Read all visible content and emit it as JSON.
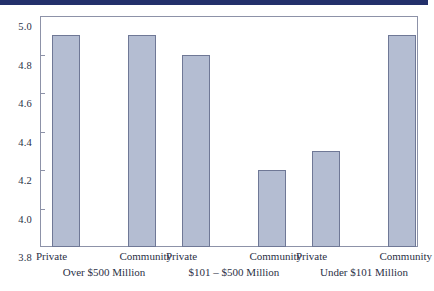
{
  "top_strip": {
    "color": "#23306b"
  },
  "chart_data": {
    "type": "bar",
    "title": "",
    "subtitle": "",
    "xlabel": "",
    "ylabel": "",
    "ylim": [
      3.8,
      5.0
    ],
    "ytick_step": 0.2,
    "ytick_labels": [
      "5.0",
      "4.8",
      "4.6",
      "4.4",
      "4.2",
      "4.0",
      "3.8"
    ],
    "ytick_values": [
      5.0,
      4.8,
      4.6,
      4.4,
      4.2,
      4.0,
      3.8
    ],
    "grid": false,
    "legend": "none",
    "categories": [
      "Private",
      "Community",
      "Private",
      "Community",
      "Private",
      "Community"
    ],
    "values": [
      4.9,
      4.9,
      4.8,
      4.2,
      4.3,
      4.9
    ],
    "groups": [
      {
        "name": "Over $500 Million",
        "bars": [
          {
            "label": "Private",
            "value": 4.9
          },
          {
            "label": "Community",
            "value": 4.9
          }
        ]
      },
      {
        "name": "$101 – $500 Million",
        "bars": [
          {
            "label": "Private",
            "value": 4.8
          },
          {
            "label": "Community",
            "value": 4.2
          }
        ]
      },
      {
        "name": "Under $101 Million",
        "bars": [
          {
            "label": "Private",
            "value": 4.3
          },
          {
            "label": "Community",
            "value": 4.9
          }
        ]
      }
    ],
    "bar_fill": "#b4bdd2",
    "bar_border": "#6f7896",
    "axis_color": "#8d92a8",
    "text_color": "#2c3146"
  }
}
